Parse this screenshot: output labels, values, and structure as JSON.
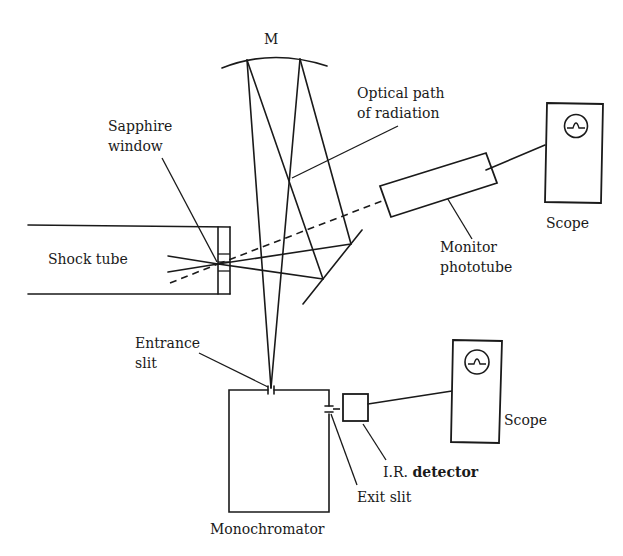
{
  "diagram": {
    "type": "experimental-apparatus-schematic",
    "labels": {
      "mirror": "M",
      "optical_path_line1": "Optical path",
      "optical_path_line2": "of radiation",
      "sapphire_line1": "Sapphire",
      "sapphire_line2": "window",
      "shock_tube": "Shock tube",
      "scope_top": "Scope",
      "monitor_line1": "Monitor",
      "monitor_line2": "phototube",
      "entrance_line1": "Entrance",
      "entrance_line2": "slit",
      "scope_bottom": "Scope",
      "ir_prefix": "I.R.",
      "ir_detector": "detector",
      "exit_slit": "Exit slit",
      "monochromator": "Monochromator"
    },
    "components": [
      {
        "id": "concave-mirror",
        "label": "M"
      },
      {
        "id": "shock-tube",
        "label": "Shock tube"
      },
      {
        "id": "sapphire-window",
        "label": "Sapphire window"
      },
      {
        "id": "flat-mirror",
        "label": ""
      },
      {
        "id": "monitor-phototube",
        "label": "Monitor phototube"
      },
      {
        "id": "scope-1",
        "label": "Scope"
      },
      {
        "id": "monochromator",
        "label": "Monochromator"
      },
      {
        "id": "entrance-slit",
        "label": "Entrance slit"
      },
      {
        "id": "exit-slit",
        "label": "Exit slit"
      },
      {
        "id": "ir-detector",
        "label": "I.R. detector"
      },
      {
        "id": "scope-2",
        "label": "Scope"
      }
    ],
    "connections": [
      {
        "from": "shock-tube",
        "to": "sapphire-window"
      },
      {
        "from": "sapphire-window",
        "to": "flat-mirror"
      },
      {
        "from": "flat-mirror",
        "to": "concave-mirror"
      },
      {
        "from": "concave-mirror",
        "to": "entrance-slit"
      },
      {
        "from": "sapphire-window",
        "to": "monitor-phototube",
        "style": "dashed"
      },
      {
        "from": "monitor-phototube",
        "to": "scope-1"
      },
      {
        "from": "exit-slit",
        "to": "ir-detector"
      },
      {
        "from": "ir-detector",
        "to": "scope-2"
      }
    ]
  }
}
